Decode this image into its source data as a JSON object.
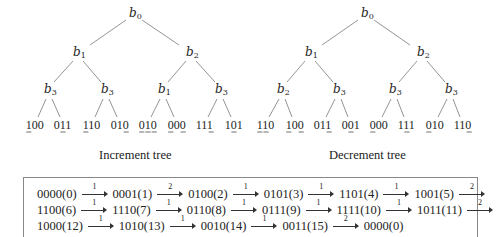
{
  "increment_tree": {
    "caption": "Increment tree",
    "root": {
      "label": "b",
      "sub": "0",
      "x": 134,
      "y": 17
    },
    "level1": [
      {
        "label": "b",
        "sub": "1",
        "x": 78,
        "y": 56
      },
      {
        "label": "b",
        "sub": "2",
        "x": 191,
        "y": 56
      }
    ],
    "level2": [
      {
        "label": "b",
        "sub": "3",
        "x": 49,
        "y": 93,
        "parent": 0
      },
      {
        "label": "b",
        "sub": "3",
        "x": 106,
        "y": 93,
        "parent": 0
      },
      {
        "label": "b",
        "sub": "1",
        "x": 163,
        "y": 93,
        "parent": 1
      },
      {
        "label": "b",
        "sub": "3",
        "x": 220,
        "y": 93,
        "parent": 1
      }
    ],
    "leaves": [
      {
        "bits": "100",
        "underline": [
          0
        ],
        "x": 35
      },
      {
        "bits": "011",
        "underline": [
          1
        ],
        "x": 63
      },
      {
        "bits": "110",
        "underline": [
          0
        ],
        "x": 92
      },
      {
        "bits": "010",
        "underline": [
          2
        ],
        "x": 120
      },
      {
        "bits": "010",
        "underline": [
          0,
          1,
          2
        ],
        "x": 148
      },
      {
        "bits": "000",
        "underline": [
          0,
          2
        ],
        "x": 177
      },
      {
        "bits": "111",
        "underline": [
          2
        ],
        "x": 205
      },
      {
        "bits": "101",
        "underline": [
          1
        ],
        "x": 234
      }
    ]
  },
  "decrement_tree": {
    "caption": "Decrement tree",
    "root": {
      "label": "b",
      "sub": "0",
      "x": 366,
      "y": 17
    },
    "level1": [
      {
        "label": "b",
        "sub": "1",
        "x": 310,
        "y": 56
      },
      {
        "label": "b",
        "sub": "2",
        "x": 422,
        "y": 56
      }
    ],
    "level2": [
      {
        "label": "b",
        "sub": "2",
        "x": 282,
        "y": 93,
        "parent": 0
      },
      {
        "label": "b",
        "sub": "3",
        "x": 338,
        "y": 93,
        "parent": 0
      },
      {
        "label": "b",
        "sub": "3",
        "x": 394,
        "y": 93,
        "parent": 1
      },
      {
        "label": "b",
        "sub": "3",
        "x": 450,
        "y": 93,
        "parent": 1
      }
    ],
    "leaves": [
      {
        "bits": "110",
        "underline": [
          0,
          1
        ],
        "x": 266
      },
      {
        "bits": "100",
        "underline": [
          0,
          2
        ],
        "x": 295
      },
      {
        "bits": "011",
        "underline": [
          2
        ],
        "x": 323
      },
      {
        "bits": "001",
        "underline": [
          1
        ],
        "x": 351
      },
      {
        "bits": "000",
        "underline": [
          0
        ],
        "x": 379
      },
      {
        "bits": "111",
        "underline": [
          1
        ],
        "x": 407
      },
      {
        "bits": "010",
        "underline": [
          0
        ],
        "x": 435
      },
      {
        "bits": "110",
        "underline": [
          2
        ],
        "x": 463
      }
    ]
  },
  "sequence": {
    "lines": [
      [
        {
          "state": "0000(0)",
          "arrow": "1"
        },
        {
          "state": "0001(1)",
          "arrow": "2"
        },
        {
          "state": "0100(2)",
          "arrow": "1"
        },
        {
          "state": "0101(3)",
          "arrow": "1"
        },
        {
          "state": "1101(4)",
          "arrow": "1"
        },
        {
          "state": "1001(5)",
          "arrow": "2"
        }
      ],
      [
        {
          "state": "1100(6)",
          "arrow": "1"
        },
        {
          "state": "1110(7)",
          "arrow": "1"
        },
        {
          "state": "0110(8)",
          "arrow": "1"
        },
        {
          "state": "0111(9)",
          "arrow": "1"
        },
        {
          "state": "1111(10)",
          "arrow": "1"
        },
        {
          "state": "1011(11)",
          "arrow": "2"
        }
      ],
      [
        {
          "state": "1000(12)",
          "arrow": "1"
        },
        {
          "state": "1010(13)",
          "arrow": "1"
        },
        {
          "state": "0010(14)",
          "arrow": "1"
        },
        {
          "state": "0011(15)",
          "arrow": "2"
        },
        {
          "state": "0000(0)",
          "arrow": null
        }
      ]
    ]
  }
}
